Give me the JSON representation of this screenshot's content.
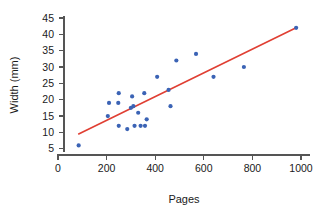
{
  "chart_data": {
    "type": "scatter",
    "title": "",
    "xlabel": "Pages",
    "ylabel": "Width (mm)",
    "xlim": [
      0,
      1050
    ],
    "ylim": [
      3,
      46
    ],
    "xticks": [
      0,
      200,
      400,
      600,
      800,
      1000
    ],
    "yticks": [
      5,
      10,
      15,
      20,
      25,
      30,
      35,
      40,
      45
    ],
    "xtick_labels": [
      "0",
      "200",
      "400",
      "600",
      "800",
      "1000"
    ],
    "ytick_labels": [
      "5",
      "10",
      "15",
      "20",
      "25",
      "30",
      "35",
      "40",
      "45"
    ],
    "grid": false,
    "legend": false,
    "point_color": "#3b63b5",
    "line_color": "#e03f33",
    "axis_color": "#555555",
    "background": "#ffffff",
    "series": [
      {
        "name": "books",
        "type": "scatter",
        "x": [
          85,
          205,
          210,
          248,
          250,
          250,
          285,
          300,
          305,
          310,
          315,
          330,
          340,
          355,
          358,
          365,
          408,
          455,
          463,
          487,
          568,
          640,
          765,
          980
        ],
        "y": [
          6,
          15,
          19,
          19,
          22,
          12,
          11,
          17.5,
          21,
          18,
          12,
          16,
          12,
          22,
          12,
          14,
          27,
          23,
          18,
          32,
          34,
          27,
          30,
          42
        ]
      },
      {
        "name": "trend line",
        "type": "line",
        "x": [
          85,
          980
        ],
        "y": [
          9.5,
          42
        ]
      }
    ]
  },
  "axes": {
    "x_title": "Pages",
    "y_title": "Width (mm)"
  }
}
